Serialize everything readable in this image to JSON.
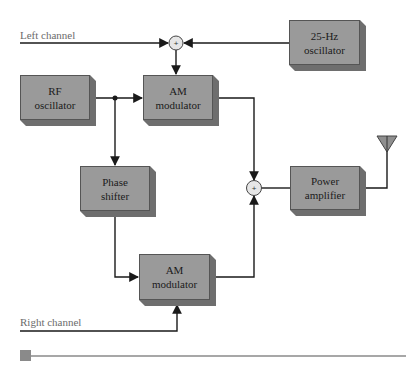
{
  "diagram": {
    "labels": {
      "left_channel": "Left channel",
      "right_channel": "Right channel"
    },
    "blocks": {
      "osc_25hz": {
        "line1": "25-Hz",
        "line2": "oscillator"
      },
      "rf_osc": {
        "line1": "RF",
        "line2": "oscillator"
      },
      "am_mod_top": {
        "line1": "AM",
        "line2": "modulator"
      },
      "phase_shifter": {
        "line1": "Phase",
        "line2": "shifter"
      },
      "power_amp": {
        "line1": "Power",
        "line2": "amplifier"
      },
      "am_mod_bottom": {
        "line1": "AM",
        "line2": "modulator"
      }
    },
    "summers": {
      "symbol": "+"
    },
    "colors": {
      "block_face": "#9a9a9a",
      "block_side": "#7a7a7a",
      "block_bottom": "#6e6e6e",
      "summer_fill": "#e6e6e6",
      "line": "#1a1a1a",
      "label_text": "#6b6b6b",
      "bottom_bar": "#8a8a8a"
    }
  }
}
